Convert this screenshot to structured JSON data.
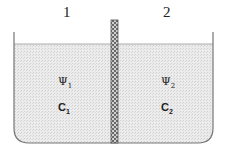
{
  "diagram": {
    "compartments": [
      {
        "label": "1",
        "potential_symbol": "Ψ",
        "potential_sub": "1",
        "concentration_symbol": "C",
        "concentration_sub": "1"
      },
      {
        "label": "2",
        "potential_symbol": "Ψ",
        "potential_sub": "2",
        "concentration_symbol": "C",
        "concentration_sub": "2"
      }
    ],
    "colors": {
      "container": "#777777",
      "liquid": "#e4e4e4",
      "membrane": "#9a9a9a",
      "text": "#222222"
    }
  }
}
